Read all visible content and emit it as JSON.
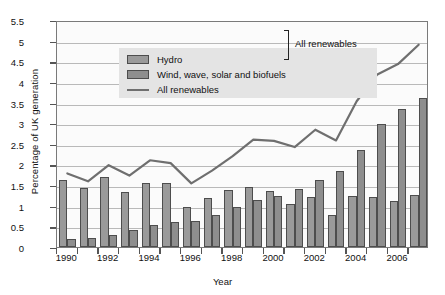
{
  "chart_data": {
    "type": "bar",
    "title": "",
    "xlabel": "Year",
    "ylabel": "Percentage of UK generation",
    "ylim": [
      0,
      5.5
    ],
    "ytick_values": [
      0,
      0.5,
      1,
      1.5,
      2,
      2.5,
      3,
      3.5,
      4,
      4.5,
      5,
      5.5
    ],
    "ytick_labels": [
      "0",
      "0.5",
      "1",
      "1.5",
      "2",
      "2.5",
      "3",
      "3.5",
      "4",
      "4.5",
      "5",
      "5.5"
    ],
    "grid": true,
    "legend_position": "upper-left",
    "categories": [
      1990,
      1991,
      1992,
      1993,
      1994,
      1995,
      1996,
      1997,
      1998,
      1999,
      2000,
      2001,
      2002,
      2003,
      2004,
      2005,
      2006,
      2007
    ],
    "xtick_labels": [
      "1990",
      "1992",
      "1994",
      "1996",
      "1998",
      "2000",
      "2002",
      "2004",
      "2006"
    ],
    "xtick_values": [
      1990,
      1992,
      1994,
      1996,
      1998,
      2000,
      2002,
      2004,
      2006
    ],
    "series": [
      {
        "name": "Hydro",
        "kind": "bar",
        "color": "#9a9a9a",
        "values": [
          1.63,
          1.44,
          1.7,
          1.34,
          1.55,
          1.55,
          0.96,
          1.18,
          1.39,
          1.45,
          1.35,
          1.05,
          1.22,
          0.77,
          1.23,
          1.21,
          1.12,
          1.25
        ]
      },
      {
        "name": "Wind, wave, solar and biofuels",
        "kind": "bar",
        "color": "#8e8e8e",
        "values": [
          0.19,
          0.22,
          0.29,
          0.42,
          0.54,
          0.6,
          0.64,
          0.78,
          0.96,
          1.15,
          1.24,
          1.41,
          1.63,
          1.85,
          2.35,
          2.98,
          3.34,
          3.62
        ]
      },
      {
        "name": "All renewables",
        "kind": "line",
        "color": "#6f6f6f",
        "values": [
          1.83,
          1.64,
          2.03,
          1.78,
          2.15,
          2.08,
          1.59,
          1.9,
          2.25,
          2.65,
          2.62,
          2.47,
          2.89,
          2.63,
          3.58,
          4.23,
          4.48,
          4.95
        ]
      }
    ],
    "annotations": [
      {
        "text": "All renewables",
        "note": "bracket grouping the two bar series"
      }
    ]
  },
  "legend": {
    "items": [
      {
        "label": "Hydro",
        "marker": "bar-swatch"
      },
      {
        "label": "Wind, wave, solar and biofuels",
        "marker": "bar-swatch"
      },
      {
        "label": "All renewables",
        "marker": "line-swatch"
      }
    ],
    "bracket_label": "All renewables"
  },
  "axes": {
    "x_title": "Year",
    "y_title": "Percentage of UK generation"
  }
}
